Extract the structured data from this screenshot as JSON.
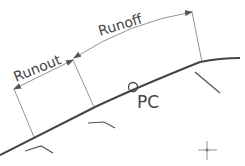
{
  "diagram": {
    "labels": {
      "runout": "Runout",
      "runoff": "Runoff",
      "pc": "PC"
    },
    "colors": {
      "line": "#444444",
      "thin": "#666666",
      "background": "#ffffff"
    }
  }
}
